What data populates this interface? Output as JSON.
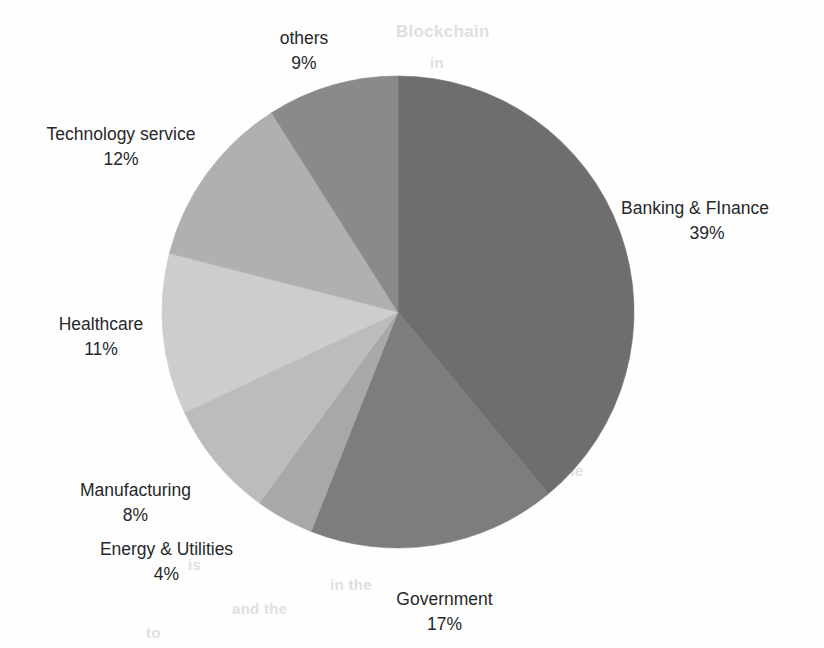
{
  "chart_data": {
    "type": "pie",
    "title": "",
    "categories": [
      "Banking & FInance",
      "Government",
      "Energy & Utilities",
      "Manufacturing",
      "Healthcare",
      "Technology service",
      "others"
    ],
    "values": [
      39,
      17,
      4,
      8,
      11,
      12,
      9
    ],
    "value_labels": [
      "39%",
      "17%",
      "4%",
      "8%",
      "11%",
      "12%",
      "9%"
    ],
    "unit": "%",
    "start_angle_deg": 0,
    "direction": "clockwise",
    "legend": "none",
    "labels_position": "outside",
    "grid": false,
    "colors": [
      "#6e6e6e",
      "#7d7d7d",
      "#a8a8a8",
      "#bcbcbc",
      "#cdcdcd",
      "#b0b0b0",
      "#8a8a8a"
    ],
    "background": "#fefefe",
    "label_color": "#26282a"
  },
  "slices": [
    {
      "name": "Banking & FInance",
      "percent": "39%",
      "color": "#6e6e6e"
    },
    {
      "name": "Government",
      "percent": "17%",
      "color": "#7d7d7d"
    },
    {
      "name": "Energy & Utilities",
      "percent": "4%",
      "color": "#a8a8a8"
    },
    {
      "name": "Manufacturing",
      "percent": "8%",
      "color": "#bcbcbc"
    },
    {
      "name": "Healthcare",
      "percent": "11%",
      "color": "#cdcdcd"
    },
    {
      "name": "Technology service",
      "percent": "12%",
      "color": "#b0b0b0"
    },
    {
      "name": "others",
      "percent": "9%",
      "color": "#8a8a8a"
    }
  ],
  "background_bleed": [
    {
      "text": "Blockchain",
      "x": 396,
      "y": 22,
      "size": 17
    },
    {
      "text": "in",
      "x": 430,
      "y": 54,
      "size": 15
    },
    {
      "text": "of",
      "x": 516,
      "y": 432,
      "size": 15
    },
    {
      "text": "the",
      "x": 560,
      "y": 462,
      "size": 15
    },
    {
      "text": "to",
      "x": 420,
      "y": 496,
      "size": 15
    },
    {
      "text": "is",
      "x": 188,
      "y": 556,
      "size": 15
    },
    {
      "text": "in the",
      "x": 330,
      "y": 576,
      "size": 15
    },
    {
      "text": "and the",
      "x": 232,
      "y": 600,
      "size": 15
    },
    {
      "text": "to",
      "x": 146,
      "y": 624,
      "size": 15
    }
  ]
}
